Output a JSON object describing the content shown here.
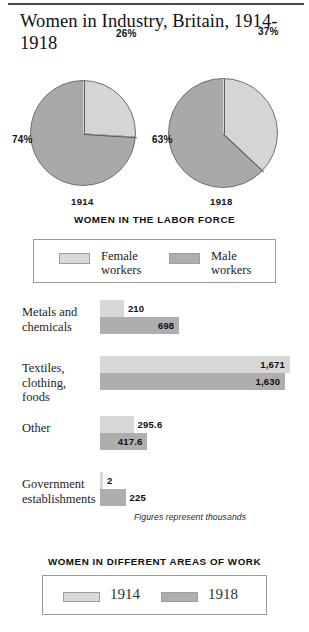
{
  "title": "Women in Industry, Britain, 1914-1918",
  "colors": {
    "female_light": "#d8d8d8",
    "male_dark": "#aeaeae",
    "pie_light": "#d5d5d5",
    "pie_dark": "#a9a9a9",
    "outline": "#6f6f6f",
    "text": "#111111"
  },
  "labor_force": {
    "caption": "WOMEN IN THE LABOR FORCE",
    "pies": [
      {
        "year": "1914",
        "female_pct_label": "26%",
        "male_pct_label": "74%",
        "female_pct": 26,
        "male_pct": 74
      },
      {
        "year": "1918",
        "female_pct_label": "37%",
        "male_pct_label": "63%",
        "female_pct": 37,
        "male_pct": 63
      }
    ],
    "legend": {
      "female_line1": "Female",
      "female_line2": "workers",
      "male_line1": "Male",
      "male_line2": "workers"
    }
  },
  "areas_of_work": {
    "caption": "WOMEN IN DIFFERENT AREAS OF WORK",
    "note": "Figures represent thousands",
    "legend": {
      "year_1914": "1914",
      "year_1918": "1918"
    },
    "rows": [
      {
        "label_line1": "Metals and",
        "label_line2": "chemicals",
        "value_1914_label": "210",
        "value_1918_label": "698",
        "value_1914": 210,
        "value_1918": 698
      },
      {
        "label_line1": "Textiles,",
        "label_line2": "clothing, foods",
        "value_1914_label": "1,671",
        "value_1918_label": "1,630",
        "value_1914": 1671,
        "value_1918": 1630
      },
      {
        "label_line1": "Other",
        "label_line2": "",
        "value_1914_label": "295.6",
        "value_1918_label": "417.6",
        "value_1914": 295.6,
        "value_1918": 417.6
      },
      {
        "label_line1": "Government",
        "label_line2": "establishments",
        "value_1914_label": "2",
        "value_1918_label": "225",
        "value_1914": 2,
        "value_1918": 225
      }
    ]
  },
  "chart_data": [
    {
      "type": "pie",
      "title": "WOMEN IN THE LABOR FORCE",
      "subtitle": "1914",
      "labels": [
        "Female workers",
        "Male workers"
      ],
      "values": [
        26,
        74
      ],
      "value_labels": [
        "26%",
        "74%"
      ],
      "legend": "inside-box-below",
      "units": "percent"
    },
    {
      "type": "pie",
      "title": "WOMEN IN THE LABOR FORCE",
      "subtitle": "1918",
      "labels": [
        "Female workers",
        "Male workers"
      ],
      "values": [
        37,
        63
      ],
      "value_labels": [
        "37%",
        "63%"
      ],
      "legend": "inside-box-below",
      "units": "percent"
    },
    {
      "type": "bar",
      "title": "WOMEN IN DIFFERENT AREAS OF WORK",
      "orientation": "horizontal",
      "categories": [
        "Metals and chemicals",
        "Textiles, clothing, foods",
        "Other",
        "Government establishments"
      ],
      "series": [
        {
          "name": "1914",
          "values": [
            210,
            1671,
            295.6,
            2
          ]
        },
        {
          "name": "1918",
          "values": [
            698,
            1630,
            417.6,
            225
          ]
        }
      ],
      "xlabel": "Figures represent thousands",
      "ylabel": "",
      "xlim": [
        0,
        1671
      ],
      "grid": false,
      "legend_position": "bottom",
      "units": "thousands"
    }
  ]
}
